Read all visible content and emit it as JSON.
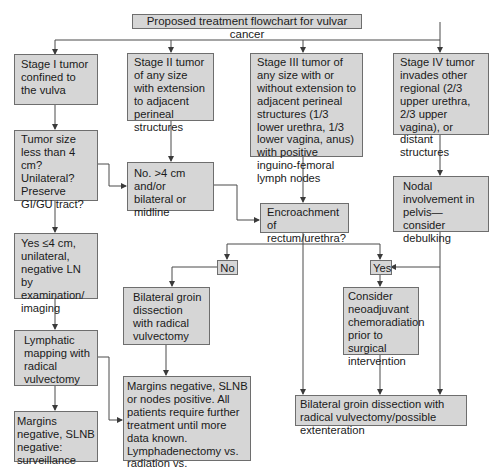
{
  "title": "Proposed treatment flowchart for vulvar cancer",
  "nodes": {
    "stage1": "Stage I tumor confined to the vulva",
    "stage2": "Stage II tumor of any size with extension to adjacent perineal structures",
    "stage3": "Stage III tumor of any size with or without extension to adjacent perineal structures (1/3 lower urethra, 1/3 lower vagina, anus) with positive inguino-femoral lymph nodes",
    "stage4": "Stage IV tumor invades other regional (2/3 upper urethra, 2/3 upper vagina), or distant structures",
    "tumor_size": "Tumor size less than 4 cm? Unilateral? Preserve GI/GU tract?",
    "no_gt4": "No. >4 cm and/or bilateral or midline",
    "nodal": "Nodal involvement in pelvis—consider debulking",
    "encroachment": "Encroachment of rectum/urethra?",
    "no_label": "No",
    "yes_label": "Yes",
    "yes_le4": "Yes ≤4 cm, unilateral, negative LN by examination/ imaging",
    "bilateral_groin": "Bilateral groin dissection with radical vulvectomy",
    "consider_neo": "Consider neoadjuvant chemoradiation prior to surgical intervention",
    "lymphatic": "Lymphatic mapping with radical vulvectomy",
    "margins_pos": "Margins negative, SLNB or nodes positive. All patients require further treatment until more data known. Lymphadenectomy vs. radiation vs. chemoradiation",
    "bilateral_exent": "Bilateral groin dissection with radical vulvectomy/possible extenteration",
    "margins_neg": "Margins negative, SLNB negative: surveillance"
  },
  "colors": {
    "box_fill": "#d6d6d6",
    "box_border": "#6e6e6e",
    "line": "#4a4a4a"
  }
}
